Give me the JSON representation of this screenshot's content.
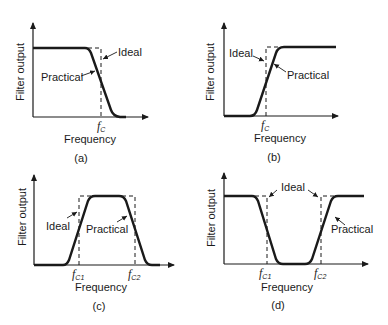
{
  "figure": {
    "panels": [
      {
        "id": "a",
        "caption": "(a)",
        "type": "low-pass",
        "ylabel": "Filter output",
        "xlabel": "Frequency",
        "cutoff_labels": [
          {
            "f": "f",
            "sub": "C"
          }
        ],
        "annotations": {
          "ideal": "Ideal",
          "practical": "Practical"
        }
      },
      {
        "id": "b",
        "caption": "(b)",
        "type": "high-pass",
        "ylabel": "Filter output",
        "xlabel": "Frequency",
        "cutoff_labels": [
          {
            "f": "f",
            "sub": "C"
          }
        ],
        "annotations": {
          "ideal": "Ideal",
          "practical": "Practical"
        }
      },
      {
        "id": "c",
        "caption": "(c)",
        "type": "band-pass",
        "ylabel": "Filter output",
        "xlabel": "Frequency",
        "cutoff_labels": [
          {
            "f": "f",
            "sub": "C1"
          },
          {
            "f": "f",
            "sub": "C2"
          }
        ],
        "annotations": {
          "ideal": "Ideal",
          "practical": "Practical"
        }
      },
      {
        "id": "d",
        "caption": "(d)",
        "type": "band-stop",
        "ylabel": "Filter output",
        "xlabel": "Frequency",
        "cutoff_labels": [
          {
            "f": "f",
            "sub": "C1"
          },
          {
            "f": "f",
            "sub": "C2"
          }
        ],
        "annotations": {
          "ideal": "Ideal",
          "practical": "Practical"
        }
      }
    ]
  },
  "colors": {
    "line": "#1a1a1a",
    "background": "#ffffff"
  }
}
